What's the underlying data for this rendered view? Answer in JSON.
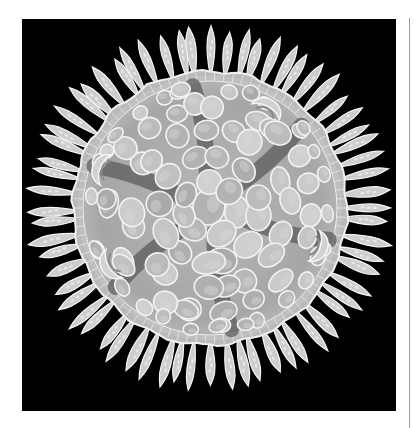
{
  "image": {
    "subject": "radiolarian-like organism illustration",
    "description": "Round, scalloped disc of packed cell-like lobes surrounded by a ring of slender leaf-shaped spines on a black background",
    "background_color": "#000000",
    "page_color": "#ffffff",
    "rule_color": "#9a9a9a"
  },
  "organism": {
    "center": [
      188,
      189
    ],
    "disc_radius": 137,
    "rim_width": 7,
    "disc_fill": "#a9a9a9",
    "rim_fill": "#c4c4c4",
    "cell_fill": "#bdbdbd",
    "cell_stroke": "#f2f2f2",
    "channel_color": "#5c5c5c",
    "channel_angles": [
      15,
      80,
      140,
      200,
      262,
      318
    ],
    "spine_count": 64,
    "spine_inner_radius": 130,
    "spine_outer_radius": 186,
    "spine_width": 9,
    "spine_fill": "#cdcdcd",
    "spine_stroke": "#f5f5f5",
    "curled_lobes_angles": [
      200,
      150,
      20,
      300
    ]
  }
}
